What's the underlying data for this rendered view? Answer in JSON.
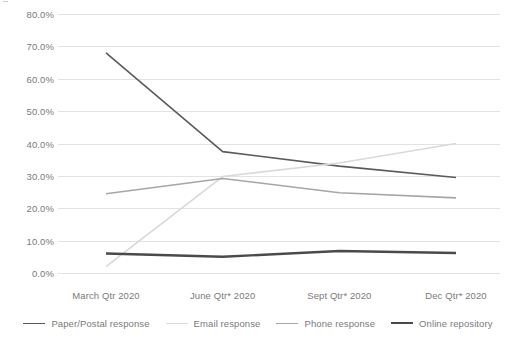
{
  "chart_data": {
    "type": "line",
    "title": "",
    "xlabel": "",
    "ylabel": "",
    "categories": [
      "March Qtr 2020",
      "June Qtr* 2020",
      "Sept Qtr* 2020",
      "Dec Qtr* 2020"
    ],
    "ylim": [
      0,
      80
    ],
    "ytick_labels": [
      "0.0%",
      "10.0%",
      "20.0%",
      "30.0%",
      "40.0%",
      "50.0%",
      "60.0%",
      "70.0%",
      "80.0%"
    ],
    "ytick_values": [
      0,
      10,
      20,
      30,
      40,
      50,
      60,
      70,
      80
    ],
    "grid": true,
    "legend_position": "bottom",
    "series": [
      {
        "name": "Paper/Postal response",
        "values": [
          68.0,
          37.5,
          33.0,
          29.5
        ],
        "color": "#5a5a5a",
        "width": 1.6
      },
      {
        "name": "Email response",
        "values": [
          2.0,
          29.8,
          34.0,
          40.0
        ],
        "color": "#d9d9d9",
        "width": 1.6
      },
      {
        "name": "Phone response",
        "values": [
          24.5,
          29.2,
          24.8,
          23.2
        ],
        "color": "#a6a6a6",
        "width": 1.6
      },
      {
        "name": "Online repository",
        "values": [
          6.0,
          5.0,
          6.8,
          6.2
        ],
        "color": "#4a4a4a",
        "width": 2.4
      }
    ]
  }
}
